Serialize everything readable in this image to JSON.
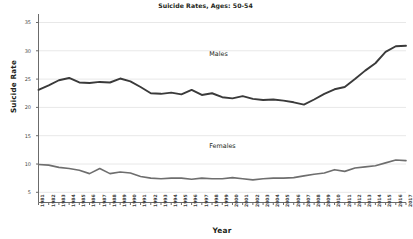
{
  "chart_data": {
    "type": "line",
    "title": "Suicide Rates, Ages: 50-54",
    "xlabel": "Year",
    "ylabel": "Suicide Rate",
    "grid": true,
    "legend_position": "inline-annotations",
    "xlim": [
      1981,
      2017
    ],
    "ylim": [
      3.2,
      36.5
    ],
    "yticks": [
      5,
      10,
      15,
      20,
      25,
      30,
      35
    ],
    "x": [
      1981,
      1982,
      1983,
      1984,
      1985,
      1986,
      1987,
      1988,
      1989,
      1990,
      1991,
      1992,
      1993,
      1994,
      1995,
      1996,
      1997,
      1998,
      1999,
      2000,
      2001,
      2002,
      2003,
      2004,
      2005,
      2006,
      2007,
      2008,
      2009,
      2010,
      2011,
      2012,
      2013,
      2014,
      2015,
      2016,
      2017
    ],
    "categories": [
      "1981",
      "1982",
      "1983",
      "1984",
      "1985",
      "1986",
      "1987",
      "1988",
      "1989",
      "1990",
      "1991",
      "1992",
      "1993",
      "1994",
      "1995",
      "1996",
      "1997",
      "1998",
      "1999",
      "2000",
      "2001",
      "2002",
      "2003",
      "2004",
      "2005",
      "2006",
      "2007",
      "2008",
      "2009",
      "2010",
      "2011",
      "2012",
      "2013",
      "2014",
      "2015",
      "2016",
      "2017"
    ],
    "series": [
      {
        "name": "Males",
        "color": "#3a3a3a",
        "label_x": 1999,
        "label_y": 29.4,
        "values": [
          23.1,
          23.9,
          24.8,
          25.2,
          24.4,
          24.3,
          24.5,
          24.4,
          25.1,
          24.6,
          23.6,
          22.5,
          22.4,
          22.6,
          22.3,
          23.1,
          22.2,
          22.5,
          21.8,
          21.6,
          22.0,
          21.5,
          21.3,
          21.4,
          21.2,
          20.9,
          20.5,
          21.4,
          22.4,
          23.2,
          23.6,
          25.0,
          26.5,
          27.8,
          29.8,
          30.8,
          30.9
        ]
      },
      {
        "name": "Females",
        "color": "#6e6e6e",
        "label_x": 1999,
        "label_y": 13.2,
        "values": [
          9.9,
          9.8,
          9.4,
          9.2,
          8.9,
          8.3,
          9.2,
          8.3,
          8.6,
          8.4,
          7.8,
          7.5,
          7.4,
          7.5,
          7.5,
          7.3,
          7.5,
          7.4,
          7.4,
          7.6,
          7.4,
          7.2,
          7.4,
          7.5,
          7.5,
          7.6,
          7.9,
          8.2,
          8.4,
          9.0,
          8.7,
          9.3,
          9.5,
          9.7,
          10.2,
          10.7,
          10.6
        ]
      }
    ]
  },
  "extra_series_points": {
    "males_tail": [
      31.8,
      30.7,
      32.0,
      30.7
    ],
    "females_tail": [
      11.0,
      11.1,
      10.9
    ]
  }
}
